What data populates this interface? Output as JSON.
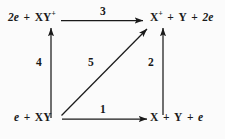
{
  "diagram": {
    "type": "reaction-cycle",
    "background_color": "#fbfbfb",
    "line_color": "#1a1a1a",
    "species": {
      "top_left": {
        "coefficient": "2",
        "electron": "e",
        "plus": "+",
        "molecule": "XY",
        "charge": "+",
        "full_text": "2e + XY⁺"
      },
      "top_right": {
        "molecule": "X",
        "charge": "+",
        "plus1": "+",
        "atom": "Y",
        "plus2": "+",
        "coefficient": "2",
        "electron": "e",
        "full_text": "X⁺ + Y + 2e"
      },
      "bottom_left": {
        "electron": "e",
        "plus": "+",
        "molecule": "XY",
        "full_text": "e + XY"
      },
      "bottom_right": {
        "molecule": "X",
        "plus1": "+",
        "atom": "Y",
        "plus2": "+",
        "electron": "e",
        "full_text": "X + Y + e"
      }
    },
    "arrows": {
      "top_horizontal": {
        "label": "3",
        "from": "top_left",
        "to": "top_right"
      },
      "bottom_horizontal": {
        "label": "1",
        "from": "bottom_left",
        "to": "bottom_right"
      },
      "left_vertical": {
        "label": "4",
        "from": "bottom_left",
        "to": "top_left"
      },
      "right_vertical": {
        "label": "2",
        "from": "bottom_right",
        "to": "top_right"
      },
      "diagonal": {
        "label": "5",
        "from": "bottom_left",
        "to": "top_right"
      }
    }
  }
}
